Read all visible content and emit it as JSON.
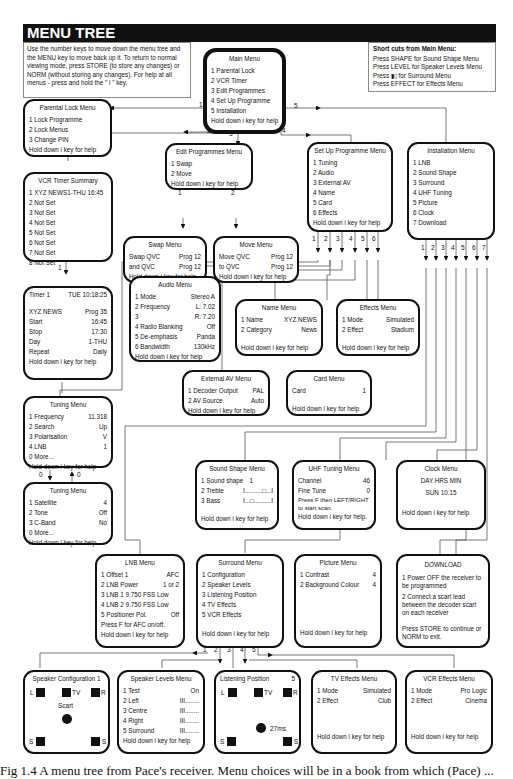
{
  "header": {
    "title": "MENU TREE"
  },
  "intro": {
    "text": "Use the number keys to move down the menu tree and the MENU key to move back up it. To return to normal viewing mode, press STORE (to store any changes) or NORM (without storing any changes). For help at all menus - press and hold the \" i \" key."
  },
  "shortcuts": {
    "title": "Short cuts from Main Menu:",
    "items": [
      "Press SHAPE for Sound Shape Menu",
      "Press LEVEL for Speaker Levels Menu",
      "Press ▮▯ for Surround Menu",
      "Press EFFECT for Effects Menu"
    ]
  },
  "help": "Hold down i key for help",
  "main_menu": {
    "title": "Main Menu",
    "items": [
      "1  Parental Lock",
      "2  VCR Timer",
      "3  Edit Programmes",
      "4  Set Up Programme",
      "5  Installation"
    ]
  },
  "parental_lock": {
    "title": "Parental Lock Menu",
    "items": [
      "1  Lock Programme",
      "2  Lock Menus",
      "3  Change PIN"
    ]
  },
  "edit_programmes": {
    "title": "Edit Programmes Menu",
    "items": [
      "1  Swap",
      "2  Move"
    ]
  },
  "setup_programme": {
    "title": "Set Up Programme Menu",
    "items": [
      "1  Tuning",
      "2  Audio",
      "3  External AV",
      "4  Name",
      "5  Card",
      "6  Effects"
    ]
  },
  "installation": {
    "title": "Installation Menu",
    "items": [
      "1  LNB",
      "2  Sound Shape",
      "3  Surround",
      "4  UHF Tuning",
      "5  Picture",
      "6  Clock",
      "7  Download"
    ]
  },
  "vcr_timer": {
    "title": "VCR Timer Summary",
    "items": [
      "1  XYZ NEWS1-THU 16:45",
      "2  Not Set",
      "3  Not Set",
      "4  Not Set",
      "5  Not Set",
      "6  Not Set",
      "7  Not Set",
      "8  Not Set"
    ]
  },
  "swap_menu": {
    "title": "Swap Menu",
    "rows": [
      [
        "Swap  QVC",
        "Prog 12"
      ],
      [
        "and  QVC",
        "Prog 12"
      ]
    ]
  },
  "move_menu": {
    "title": "Move Menu",
    "rows": [
      [
        "Move  QVC",
        "Prog 12"
      ],
      [
        "to  QVC",
        "Prog 12"
      ]
    ]
  },
  "timer1": {
    "title_left": "Timer 1",
    "title_right": "TUE 10:18:25",
    "rows": [
      [
        "XYZ NEWS",
        "Prog 35"
      ],
      [
        "Start",
        "16:45"
      ],
      [
        "Stop",
        "17:30"
      ],
      [
        "Day",
        "1-THU"
      ],
      [
        "Repeat",
        "Daily"
      ]
    ]
  },
  "audio_menu": {
    "title": "Audio Menu",
    "rows": [
      [
        "1  Mode",
        "Stereo A"
      ],
      [
        "2  Frequency",
        "L: 7.02"
      ],
      [
        "3",
        "R: 7.20"
      ],
      [
        "4  Radio Blanking",
        "Off"
      ],
      [
        "5  De-emphasis",
        "Panda"
      ],
      [
        "6  Bandwidth",
        "130kHz"
      ]
    ]
  },
  "name_menu": {
    "title": "Name Menu",
    "rows": [
      [
        "1  Name",
        "XYZ NEWS"
      ],
      [
        "2  Category",
        "News"
      ]
    ]
  },
  "effects_menu": {
    "title": "Effects Menu",
    "rows": [
      [
        "1  Mode",
        "Simulated"
      ],
      [
        "2  Effect",
        "Stadium"
      ]
    ]
  },
  "external_av": {
    "title": "External AV Menu",
    "rows": [
      [
        "1  Decoder Output",
        "PAL"
      ],
      [
        "2  AV Source",
        "Auto"
      ]
    ]
  },
  "card_menu": {
    "title": "Card Menu",
    "rows": [
      [
        "Card",
        "1"
      ]
    ]
  },
  "tuning_menu_1": {
    "title": "Tuning Menu",
    "rows": [
      [
        "1  Frequency",
        "11.318"
      ],
      [
        "2  Search",
        "Up"
      ],
      [
        "3  Polarisation",
        "V"
      ],
      [
        "4  LNB",
        "1"
      ],
      [
        "0  More...",
        ""
      ]
    ]
  },
  "tuning_menu_2": {
    "title": "Tuning Menu",
    "rows": [
      [
        "1  Satellite",
        "4"
      ],
      [
        "2  Tone",
        "Off"
      ],
      [
        "3  C-Band",
        "No"
      ],
      [
        "0  More...",
        ""
      ]
    ]
  },
  "sound_shape": {
    "title": "Sound Shape Menu",
    "rows": [
      [
        "1  Sound shape",
        "1"
      ],
      [
        "2  Treble",
        "I..........□...I"
      ],
      [
        "3  Bass",
        "I...□..........I"
      ]
    ]
  },
  "uhf_tuning": {
    "title": "UHF Tuning Menu",
    "rows": [
      [
        "Channel",
        "46"
      ],
      [
        "Fine Tune",
        "0"
      ]
    ],
    "note": "Press F then LEFT/RIGHT to start scan.",
    "help": "Hold down i key for help."
  },
  "clock_menu": {
    "title": "Clock Menu",
    "line1": "DAY HRS MIN",
    "line2": "SUN 10.15"
  },
  "lnb_menu": {
    "title": "LNB Menu",
    "rows": [
      [
        "1  Offset 1",
        "AFC"
      ],
      [
        "2  LNB Power",
        "1 or 2"
      ],
      [
        "3  LNB 1   9.750 FSS Low",
        ""
      ],
      [
        "4  LNB 2   9.750 FSS Low",
        ""
      ],
      [
        "5  Positioner Pol.",
        "Off"
      ]
    ],
    "note": "Press F for AFC on/off."
  },
  "surround_menu": {
    "title": "Surround Menu",
    "items": [
      "1  Configuration",
      "2  Speaker Levels",
      "3  Listening Position",
      "4  TV Effects",
      "5  VCR Effects"
    ]
  },
  "picture_menu": {
    "title": "Picture Menu",
    "rows": [
      [
        "1  Contrast",
        "4"
      ],
      [
        "2  Background Colour",
        "4"
      ]
    ]
  },
  "download": {
    "title": "DOWNLOAD",
    "step1": "1  Power OFF the receiver to be programmed",
    "step2": "2  Connect a scart lead between the decoder scart on each receiver",
    "note": "Press STORE to continue or NORM to exit."
  },
  "speaker_config": {
    "title": "Speaker Configuration 1",
    "labels": {
      "l": "L",
      "tv": "TV",
      "r": "R",
      "s1": "S",
      "s2": "S",
      "center": "Scart"
    }
  },
  "speaker_levels": {
    "title": "Speaker Levels Menu",
    "rows": [
      [
        "1  Test",
        "On"
      ],
      [
        "2  Left",
        "III........"
      ],
      [
        "3  Centre",
        "III........"
      ],
      [
        "4  Right",
        "III........"
      ],
      [
        "5  Surround",
        "III........"
      ]
    ]
  },
  "listening_position": {
    "title": "Listening Position",
    "value": "5",
    "delay": "27ms",
    "labels": {
      "l": "L",
      "tv": "TV",
      "r": "R",
      "s1": "S",
      "s2": "S"
    }
  },
  "tv_effects": {
    "title": "TV Effects Menu",
    "rows": [
      [
        "1  Mode",
        "Simulated"
      ],
      [
        "2  Effect",
        "Club"
      ]
    ]
  },
  "vcr_effects": {
    "title": "VCR Effects Menu",
    "rows": [
      [
        "1  Mode",
        "Pro Logic"
      ],
      [
        "2  Effect",
        "Cinema"
      ]
    ]
  },
  "connector_labels": {
    "main": [
      "1",
      "2",
      "3",
      "4",
      "5"
    ],
    "edit": [
      "1",
      "2"
    ],
    "setup": [
      "1",
      "2",
      "3",
      "4",
      "5",
      "6"
    ],
    "install": [
      "1",
      "2",
      "3",
      "4",
      "5",
      "6",
      "7"
    ],
    "surround": [
      "1",
      "2",
      "3",
      "4",
      "5"
    ],
    "tuning": [
      "0",
      "0"
    ],
    "vcr": [
      "1"
    ]
  },
  "caption": "Fig 1.4  A menu tree from Pace's receiver.  Menu choices will be in a  book  from  which  (Pace) ..."
}
